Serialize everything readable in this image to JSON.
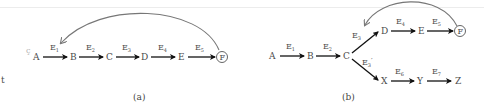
{
  "colors": {
    "background": "#ffffff",
    "arrow": "#111111",
    "curve": "#777777",
    "text": "#4a4a4a"
  },
  "diagram_a": {
    "caption": "(a)",
    "nodes": [
      "A",
      "B",
      "C",
      "D",
      "E",
      "F"
    ],
    "terminal_node": "F",
    "edges": [
      {
        "from": "A",
        "to": "B",
        "label": "E",
        "sub": "1"
      },
      {
        "from": "B",
        "to": "C",
        "label": "E",
        "sub": "2"
      },
      {
        "from": "C",
        "to": "D",
        "label": "E",
        "sub": "3"
      },
      {
        "from": "D",
        "to": "E",
        "label": "E",
        "sub": "4"
      },
      {
        "from": "E",
        "to": "F",
        "label": "E",
        "sub": "5"
      }
    ],
    "feedback": {
      "from": "F",
      "to": "E1"
    },
    "margin_marks": [
      "ç",
      "t"
    ]
  },
  "diagram_b": {
    "caption": "(b)",
    "nodes": [
      "A",
      "B",
      "C",
      "D",
      "E",
      "F",
      "X",
      "Y",
      "Z"
    ],
    "terminal_node": "F",
    "edges": [
      {
        "from": "A",
        "to": "B",
        "label": "E",
        "sub": "1"
      },
      {
        "from": "B",
        "to": "C",
        "label": "E",
        "sub": "2"
      },
      {
        "from": "C",
        "to": "D",
        "label": "E",
        "sub": "3"
      },
      {
        "from": "C",
        "to": "X",
        "label": "E",
        "sub": "3",
        "prime": "′"
      },
      {
        "from": "D",
        "to": "E",
        "label": "E",
        "sub": "4"
      },
      {
        "from": "E",
        "to": "F",
        "label": "E",
        "sub": "5"
      },
      {
        "from": "X",
        "to": "Y",
        "label": "E",
        "sub": "6"
      },
      {
        "from": "Y",
        "to": "Z",
        "label": "E",
        "sub": "7"
      }
    ],
    "feedback": {
      "from": "F",
      "to": "E3"
    }
  }
}
